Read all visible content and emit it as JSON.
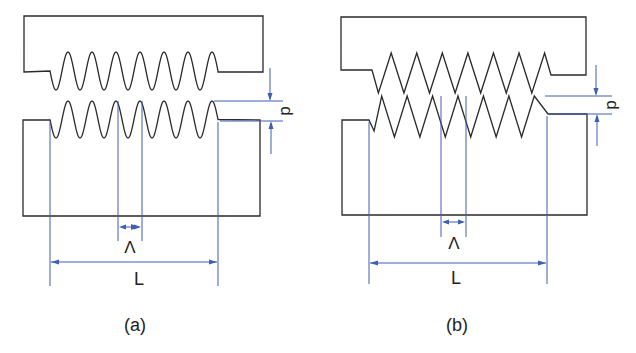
{
  "figure": {
    "panels": [
      {
        "id": "a",
        "caption": "(a)",
        "profile": "sinusoidal",
        "labels": {
          "depth": "d",
          "period": "Λ",
          "length": "L"
        },
        "periods": 7
      },
      {
        "id": "b",
        "caption": "(b)",
        "profile": "triangular",
        "labels": {
          "depth": "d",
          "period": "Λ",
          "length": "L"
        },
        "periods": 7
      }
    ],
    "colors": {
      "outline": "#2a2a2a",
      "dimension": "#3f5fb0",
      "background": "#ffffff"
    }
  }
}
